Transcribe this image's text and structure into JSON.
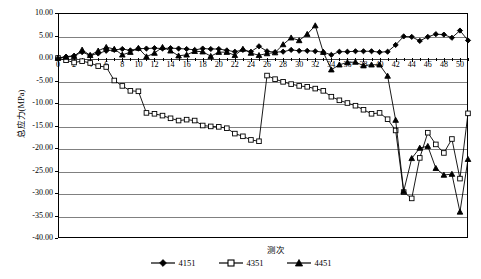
{
  "chart_data": {
    "type": "line",
    "title": "",
    "xlabel": "测次",
    "ylabel": "总应力(MPa)",
    "xlim": [
      0,
      51
    ],
    "ylim": [
      -40.0,
      10.0
    ],
    "ytick_step": 5.0,
    "xtick_step": 2,
    "grid": true,
    "legend_position": "bottom",
    "ytick_labels": [
      "10.00",
      "5.00",
      "0.00",
      "-5.00",
      "-10.00",
      "-15.00",
      "-20.00",
      "-25.00",
      "-30.00",
      "-35.00",
      "-40.00"
    ],
    "ytick_values": [
      10,
      5,
      0,
      -5,
      -10,
      -15,
      -20,
      -25,
      -30,
      -35,
      -40
    ],
    "xtick_labels": [
      "0",
      "2",
      "4",
      "6",
      "8",
      "10",
      "12",
      "14",
      "16",
      "18",
      "20",
      "22",
      "24",
      "26",
      "28",
      "30",
      "32",
      "34",
      "36",
      "38",
      "40",
      "42",
      "44",
      "46",
      "48",
      "50"
    ],
    "xtick_values": [
      0,
      2,
      4,
      6,
      8,
      10,
      12,
      14,
      16,
      18,
      20,
      22,
      24,
      26,
      28,
      30,
      32,
      34,
      36,
      38,
      40,
      42,
      44,
      46,
      48,
      50
    ],
    "x": [
      0,
      1,
      2,
      3,
      4,
      5,
      6,
      7,
      8,
      9,
      10,
      11,
      12,
      13,
      14,
      15,
      16,
      17,
      18,
      19,
      20,
      21,
      22,
      23,
      24,
      25,
      26,
      27,
      28,
      29,
      30,
      31,
      32,
      33,
      34,
      35,
      36,
      37,
      38,
      39,
      40,
      41,
      42,
      43,
      44,
      45,
      46,
      47,
      48,
      49,
      50,
      51
    ],
    "series": [
      {
        "name": "4151",
        "marker": "diamond",
        "color": "#000000",
        "values": [
          0.0,
          0.3,
          0.5,
          1.3,
          0.6,
          1.0,
          1.6,
          1.8,
          2.0,
          1.7,
          2.1,
          2.1,
          2.2,
          2.1,
          2.2,
          2.1,
          2.0,
          1.8,
          2.1,
          2.0,
          2.0,
          1.7,
          1.4,
          1.8,
          1.4,
          2.6,
          1.5,
          1.3,
          1.4,
          1.8,
          1.6,
          1.6,
          1.5,
          1.3,
          0.7,
          1.4,
          1.4,
          1.5,
          1.5,
          1.5,
          1.3,
          1.4,
          2.9,
          4.8,
          4.7,
          3.8,
          4.7,
          5.3,
          5.2,
          4.5,
          6.1,
          3.9
        ]
      },
      {
        "name": "4351",
        "marker": "square",
        "color": "#000000",
        "values": [
          0.0,
          -0.5,
          -1.0,
          -0.7,
          -1.1,
          -1.8,
          -2.0,
          -5.0,
          -6.2,
          -7.3,
          -7.4,
          -12.2,
          -12.4,
          -12.8,
          -13.4,
          -13.9,
          -13.7,
          -13.9,
          -15.0,
          -15.2,
          -15.3,
          -15.6,
          -16.8,
          -17.4,
          -18.2,
          -18.5,
          -3.9,
          -4.7,
          -5.3,
          -5.8,
          -6.2,
          -6.4,
          -6.8,
          -7.3,
          -8.6,
          -9.4,
          -10.0,
          -10.6,
          -11.5,
          -12.4,
          -12.2,
          -13.6,
          -16.1,
          -29.8,
          -31.2,
          -22.2,
          -16.6,
          -19.2,
          -21.1,
          -18.0,
          -26.8,
          -12.3
        ]
      },
      {
        "name": "4451",
        "marker": "triangle",
        "color": "#000000",
        "values": [
          0.0,
          0.2,
          0.4,
          1.8,
          0.6,
          1.6,
          2.4,
          2.0,
          0.7,
          1.3,
          2.2,
          0.3,
          1.1,
          2.4,
          1.6,
          0.5,
          0.7,
          1.5,
          1.4,
          0.4,
          1.3,
          1.3,
          0.6,
          2.0,
          1.1,
          0.6,
          1.0,
          1.2,
          3.0,
          4.5,
          3.9,
          5.3,
          7.2,
          1.3,
          -2.6,
          -1.5,
          -1.0,
          -0.9,
          -1.7,
          -1.5,
          -1.5,
          -4.0,
          -13.8,
          -29.6,
          -22.3,
          -20.0,
          -19.6,
          -24.5,
          -26.0,
          -25.8,
          -34.2,
          -22.5
        ]
      }
    ]
  },
  "legend": {
    "items": [
      {
        "label": "4151"
      },
      {
        "label": "4351"
      },
      {
        "label": "4451"
      }
    ]
  }
}
